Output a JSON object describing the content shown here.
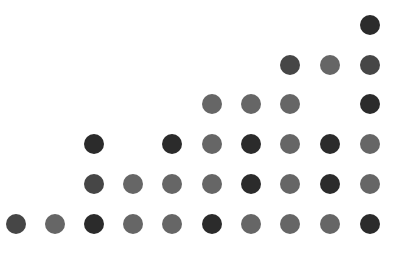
{
  "grid": {
    "columns_x": [
      16,
      55,
      94,
      133,
      172,
      212,
      251,
      290,
      330,
      370
    ],
    "rows_y": [
      25,
      65,
      104,
      144,
      184,
      224
    ],
    "dot_diameter": 20,
    "palette": {
      "D": "#2b2b2b",
      "M": "#464646",
      "L": "#666666"
    },
    "rows": [
      [
        null,
        null,
        null,
        null,
        null,
        null,
        null,
        null,
        null,
        "D"
      ],
      [
        null,
        null,
        null,
        null,
        null,
        null,
        null,
        "M",
        "L",
        "M"
      ],
      [
        null,
        null,
        null,
        null,
        null,
        "L",
        "L",
        "L",
        null,
        "D"
      ],
      [
        null,
        null,
        "D",
        null,
        "D",
        "L",
        "D",
        "L",
        "D",
        "L"
      ],
      [
        null,
        null,
        "M",
        "L",
        "L",
        "L",
        "D",
        "L",
        "D",
        "L"
      ],
      [
        "M",
        "L",
        "D",
        "L",
        "L",
        "D",
        "L",
        "L",
        "L",
        "D"
      ]
    ]
  }
}
